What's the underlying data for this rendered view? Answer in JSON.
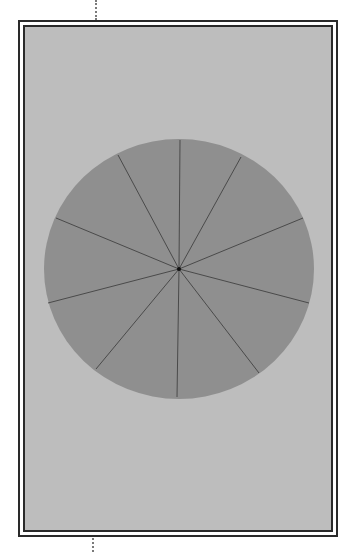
{
  "diagram": {
    "type": "segmented-circle",
    "segments": 10,
    "colors": {
      "page_background": "#ffffff",
      "panel_fill": "#bdbdbd",
      "frame_line": "#2a2a2a",
      "disc_fill": "#8f8f8f",
      "radial_line": "#4a4a4a",
      "center_dot": "#111111"
    },
    "disc": {
      "center": [
        179,
        269
      ],
      "rx": 135,
      "ry": 130
    },
    "radial_endpoints": [
      [
        180,
        140
      ],
      [
        241,
        157
      ],
      [
        303,
        218
      ],
      [
        309,
        303
      ],
      [
        259,
        373
      ],
      [
        177,
        397
      ],
      [
        96,
        369
      ],
      [
        48,
        303
      ],
      [
        56,
        218
      ],
      [
        118,
        155
      ]
    ]
  }
}
